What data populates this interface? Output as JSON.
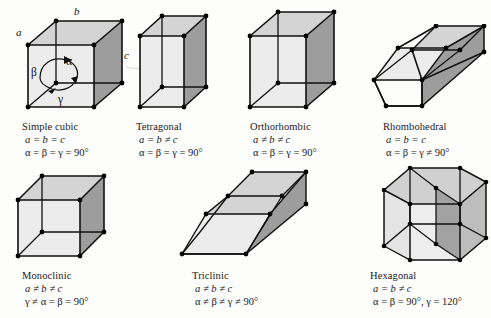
{
  "figure": {
    "background_color": "#fdfdfc",
    "edge_color": "#111111",
    "vertex_color": "#000000",
    "face_light": "#d6d6d6",
    "face_mid": "#c9c9c9",
    "face_dark": "#9a9a9a",
    "face_pale": "#ececec"
  },
  "annotations": {
    "axis_a": "a",
    "axis_b": "b",
    "axis_c": "c",
    "angle_alpha": "α",
    "angle_beta": "β",
    "angle_gamma": "γ"
  },
  "systems": [
    {
      "id": "simple-cubic",
      "name": "Simple cubic",
      "edge_relation": "a = b = c",
      "angle_relation": "α = β = γ = 90°",
      "row": 1,
      "column": 1
    },
    {
      "id": "tetragonal",
      "name": "Tetragonal",
      "edge_relation": "a = b ≠ c",
      "angle_relation": "α = β = γ = 90°",
      "row": 1,
      "column": 2
    },
    {
      "id": "orthorhombic",
      "name": "Orthorhombic",
      "edge_relation": "a ≠ b ≠ c",
      "angle_relation": "α = β = γ = 90°",
      "row": 1,
      "column": 3
    },
    {
      "id": "rhombohedral",
      "name": "Rhombohedral",
      "edge_relation": "a = b = c",
      "angle_relation": "α = β = γ ≠ 90°",
      "row": 1,
      "column": 4
    },
    {
      "id": "monoclinic",
      "name": "Monoclinic",
      "edge_relation": "a ≠ b ≠ c",
      "angle_relation": "γ ≠ α = β = 90°",
      "row": 2,
      "column": 1
    },
    {
      "id": "triclinic",
      "name": "Triclinic",
      "edge_relation": "a ≠ b ≠ c",
      "angle_relation": "α ≠ β ≠ γ ≠ 90°",
      "row": 2,
      "column": 2
    },
    {
      "id": "hexagonal",
      "name": "Hexagonal",
      "edge_relation": "a = b ≠ c",
      "angle_relation": "α = β = 90°, γ = 120°",
      "row": 2,
      "column": 3
    }
  ]
}
